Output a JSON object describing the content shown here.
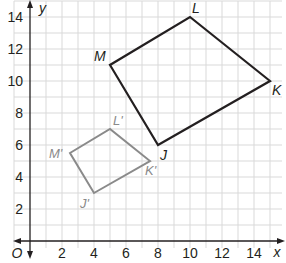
{
  "diagram": {
    "type": "coordinate-plane",
    "axes": {
      "x_label": "x",
      "y_label": "y",
      "origin_label": "O",
      "x_ticks": [
        "2",
        "4",
        "6",
        "8",
        "10",
        "12",
        "14"
      ],
      "y_ticks": [
        "2",
        "4",
        "6",
        "8",
        "10",
        "12",
        "14"
      ],
      "x_range": [
        -1,
        15.5
      ],
      "y_range": [
        -1,
        15
      ],
      "grid_step": 1
    },
    "shapes": [
      {
        "name": "JKLM",
        "color": "#231f20",
        "vertices": [
          {
            "label": "J",
            "x": 8,
            "y": 6
          },
          {
            "label": "K",
            "x": 15,
            "y": 10
          },
          {
            "label": "L",
            "x": 10,
            "y": 14
          },
          {
            "label": "M",
            "x": 5,
            "y": 11
          }
        ]
      },
      {
        "name": "J'K'L'M'",
        "color": "#8a8a8a",
        "vertices": [
          {
            "label": "J'",
            "x": 4,
            "y": 3
          },
          {
            "label": "K'",
            "x": 7.5,
            "y": 5
          },
          {
            "label": "L'",
            "x": 5,
            "y": 7
          },
          {
            "label": "M'",
            "x": 2.5,
            "y": 5.5
          }
        ]
      }
    ],
    "colors": {
      "grid": "#d9d9d9",
      "axis": "#231f20",
      "original": "#231f20",
      "image": "#8a8a8a"
    }
  }
}
